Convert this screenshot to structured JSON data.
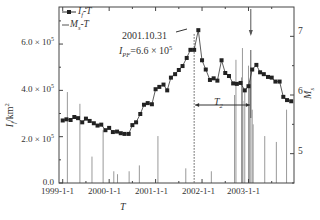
{
  "chart_data": {
    "type": "line",
    "title": "",
    "xlabel": "T",
    "ylabel_left": "I_f/km²",
    "ylabel_right": "M_s",
    "x_tick_labels": [
      "1999-1-1",
      "2000-1-1",
      "2001-1-1",
      "2002-1-1",
      "2003-1-1"
    ],
    "y_left_tick_labels": [
      "0.0",
      "2.0 × 10⁵",
      "4.0 × 10⁵",
      "6.0 × 10⁵"
    ],
    "y_left_ticks": [
      0,
      200000,
      400000,
      600000
    ],
    "y_left_range": [
      0,
      760000
    ],
    "y_right_tick_labels": [
      "5",
      "6",
      "7"
    ],
    "y_right_ticks": [
      5,
      6,
      7
    ],
    "y_right_range": [
      4.5,
      7.5
    ],
    "x_range": [
      "1999-01-01",
      "2003-12-31"
    ],
    "grid": false,
    "legend": {
      "position": "top-left",
      "entries": [
        {
          "label": "I_f-T",
          "marker": "square",
          "line": true
        },
        {
          "label": "M_s-T",
          "marker": "none",
          "line": true
        }
      ]
    },
    "series": [
      {
        "name": "I_f-T",
        "x_year": [
          1999.0,
          1999.08,
          1999.17,
          1999.25,
          1999.33,
          1999.42,
          1999.5,
          1999.58,
          1999.67,
          1999.75,
          1999.83,
          1999.92,
          2000.0,
          2000.08,
          2000.17,
          2000.25,
          2000.33,
          2000.42,
          2000.5,
          2000.58,
          2000.67,
          2000.75,
          2000.83,
          2000.92,
          2001.0,
          2001.08,
          2001.17,
          2001.25,
          2001.33,
          2001.42,
          2001.5,
          2001.58,
          2001.67,
          2001.75,
          2001.83,
          2001.92,
          2002.0,
          2002.08,
          2002.17,
          2002.25,
          2002.33,
          2002.42,
          2002.5,
          2002.58,
          2002.67,
          2002.75,
          2002.83,
          2002.92,
          2003.0,
          2003.08,
          2003.17,
          2003.25,
          2003.33,
          2003.42,
          2003.5,
          2003.58,
          2003.67,
          2003.75,
          2003.83,
          2003.92
        ],
        "values": [
          270000,
          275000,
          272000,
          285000,
          280000,
          262000,
          278000,
          268000,
          258000,
          248000,
          252000,
          228000,
          238000,
          220000,
          222000,
          215000,
          212000,
          212000,
          250000,
          262000,
          298000,
          338000,
          345000,
          340000,
          405000,
          415000,
          425000,
          400000,
          455000,
          470000,
          488000,
          505000,
          540000,
          575000,
          575000,
          660000,
          530000,
          490000,
          445000,
          452000,
          442000,
          530000,
          475000,
          462000,
          430000,
          428000,
          432000,
          400000,
          418000,
          490000,
          510000,
          478000,
          470000,
          458000,
          455000,
          438000,
          438000,
          372000,
          358000,
          353000
        ],
        "marker": "square",
        "color": "#222222"
      },
      {
        "name": "M_s-T",
        "type": "stem",
        "x_year": [
          1999.1,
          1999.37,
          1999.63,
          1999.87,
          2000.1,
          2000.18,
          2000.43,
          2000.65,
          2001.05,
          2001.65,
          2002.2,
          2002.7,
          2002.73,
          2002.85,
          2002.87,
          2002.88,
          2002.92,
          2003.0,
          2003.02,
          2003.05,
          2003.08,
          2003.1,
          2003.35,
          2003.6,
          2003.82
        ],
        "values": [
          6.05,
          5.85,
          4.95,
          5.4,
          4.7,
          4.65,
          4.7,
          4.8,
          5.3,
          4.75,
          4.7,
          6.0,
          6.6,
          6.3,
          6.8,
          5.9,
          6.1,
          6.5,
          6.2,
          6.4,
          5.75,
          5.5,
          5.3,
          5.2,
          5.75
        ],
        "color": "#999999"
      }
    ],
    "annotations": [
      {
        "text": "2001.10.31",
        "points_to": "peak",
        "x_year": 2001.83,
        "value": 660000
      },
      {
        "text": "I_PF=6.6 × 10⁵"
      },
      {
        "text": "T_2",
        "type": "double-arrow",
        "from_year": 2001.83,
        "to_year": 2003.05
      },
      {
        "type": "vertical-dotted-line",
        "x_year": 2001.83
      },
      {
        "type": "down-arrow",
        "x_year": 2003.05
      }
    ]
  },
  "legend": {
    "entry1": "I",
    "entry1_sub": "f",
    "entry1_tail": "-T",
    "entry2": "M",
    "entry2_sub": "s",
    "entry2_tail": "-T"
  },
  "annotation": {
    "date": "2001.10.31",
    "ipf_prefix": "I",
    "ipf_sub": "PF",
    "ipf_value": "=6.6 × 10",
    "ipf_exp": "5",
    "t2": "T",
    "t2_sub": "2"
  },
  "axes": {
    "x_title": "T",
    "y_left_title": "I",
    "y_left_sub": "f",
    "y_left_unit": "/km",
    "y_left_unit_exp": "2",
    "y_right_title": "M",
    "y_right_sub": "s",
    "y_left_labels": [
      {
        "mant": "0.0",
        "exp": ""
      },
      {
        "mant": "2.0 × 10",
        "exp": "5"
      },
      {
        "mant": "4.0 × 10",
        "exp": "5"
      },
      {
        "mant": "6.0 × 10",
        "exp": "5"
      }
    ],
    "y_right_labels": [
      "5",
      "6",
      "7"
    ],
    "x_labels": [
      "1999-1-1",
      "2000-1-1",
      "2001-1-1",
      "2002-1-1",
      "2003-1-1"
    ]
  }
}
